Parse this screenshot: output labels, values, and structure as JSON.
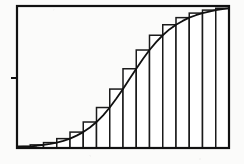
{
  "figure": {
    "title": "",
    "caption": "",
    "background_color": "#fbfbfa",
    "ink_color": "#111111",
    "frame": {
      "name": "plot-frame",
      "x": 17,
      "y": 6,
      "width": 212,
      "height": 142,
      "stroke_width": 2.2
    },
    "axis_tick": {
      "name": "left-axis-tick",
      "x1": 11,
      "y1": 78,
      "x2": 17,
      "y2": 78,
      "stroke_width": 2
    }
  },
  "chart_data": {
    "type": "bar",
    "title": "",
    "subtitle": "",
    "xlabel": "",
    "ylabel": "",
    "grid": false,
    "legend": null,
    "annotations": [],
    "xlim": [
      0,
      16
    ],
    "ylim": [
      0,
      1
    ],
    "bar_count": 16,
    "bar_alignment": "right-endpoint",
    "categories": [
      "1",
      "2",
      "3",
      "4",
      "5",
      "6",
      "7",
      "8",
      "9",
      "10",
      "11",
      "12",
      "13",
      "14",
      "15",
      "16"
    ],
    "values": [
      0.012,
      0.022,
      0.038,
      0.066,
      0.112,
      0.183,
      0.285,
      0.415,
      0.558,
      0.69,
      0.794,
      0.868,
      0.918,
      0.95,
      0.971,
      0.984
    ],
    "xtick_labels": [],
    "ytick_labels": [],
    "series": [
      {
        "name": "rectangles",
        "type": "bar",
        "values": [
          0.012,
          0.022,
          0.038,
          0.066,
          0.112,
          0.183,
          0.285,
          0.415,
          0.558,
          0.69,
          0.794,
          0.868,
          0.918,
          0.95,
          0.971,
          0.984
        ],
        "fill_color": "#ffffff",
        "edge_color": "#1a1a1a",
        "edge_width": 1.5
      },
      {
        "name": "curve",
        "type": "line",
        "x": [
          0.0,
          0.5,
          1.0,
          1.5,
          2.0,
          2.5,
          3.0,
          3.5,
          4.0,
          4.5,
          5.0,
          5.5,
          6.0,
          6.5,
          7.0,
          7.5,
          8.0,
          8.5,
          9.0,
          9.5,
          10.0,
          10.5,
          11.0,
          11.5,
          12.0,
          12.5,
          13.0,
          13.5,
          14.0,
          14.5,
          15.0,
          15.5,
          16.0
        ],
        "y": [
          0.008,
          0.01,
          0.012,
          0.016,
          0.022,
          0.029,
          0.038,
          0.05,
          0.066,
          0.087,
          0.112,
          0.144,
          0.183,
          0.23,
          0.285,
          0.348,
          0.415,
          0.487,
          0.558,
          0.627,
          0.69,
          0.746,
          0.794,
          0.835,
          0.868,
          0.895,
          0.918,
          0.935,
          0.95,
          0.961,
          0.971,
          0.978,
          0.984
        ],
        "color": "#111111",
        "width": 1.8
      }
    ]
  }
}
